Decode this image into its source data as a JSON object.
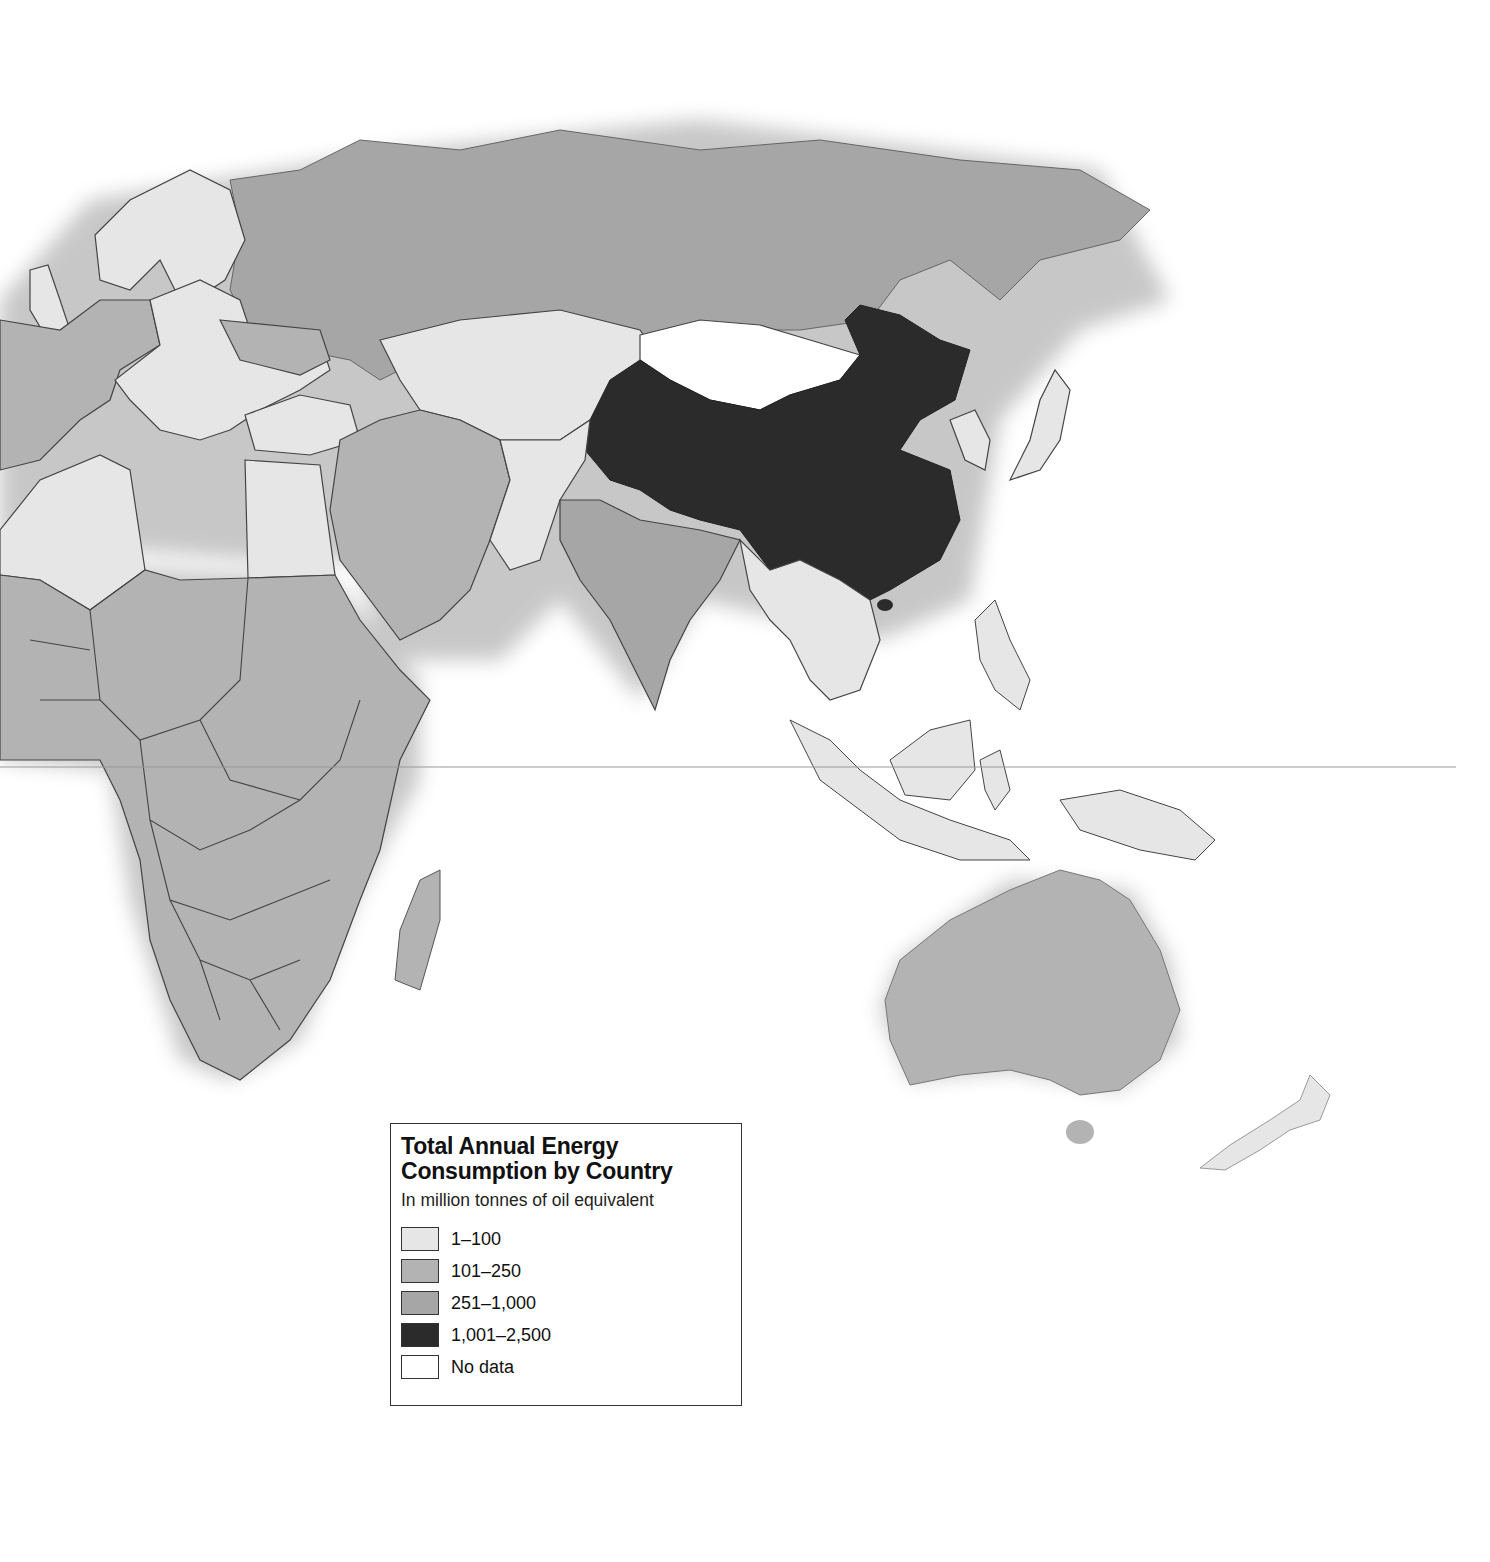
{
  "legend": {
    "title": "Total Annual Energy Consumption by Country",
    "title_line1": "Total Annual Energy",
    "title_line2": "Consumption by Country",
    "subtitle": "In million tonnes of oil equivalent",
    "items": [
      {
        "label": "1–100",
        "color": "#e6e6e6"
      },
      {
        "label": "101–250",
        "color": "#b3b3b3"
      },
      {
        "label": "251–1,000",
        "color": "#a6a6a6"
      },
      {
        "label": "1,001–2,500",
        "color": "#2b2b2b"
      },
      {
        "label": "No data",
        "color": "#ffffff"
      }
    ]
  },
  "map": {
    "colors": {
      "class_1_100": "#e6e6e6",
      "class_101_250": "#b3b3b3",
      "class_251_1000": "#a6a6a6",
      "class_1001_2500": "#2b2b2b",
      "no_data": "#ffffff",
      "border": "#444444",
      "equator": "#999999"
    },
    "regions": [
      {
        "name": "China",
        "class": "1,001–2,500"
      },
      {
        "name": "Russia",
        "class": "251–1,000"
      },
      {
        "name": "India",
        "class": "251–1,000"
      },
      {
        "name": "Japan",
        "class": "251–1,000"
      },
      {
        "name": "Africa (most countries)",
        "class": "101–250"
      },
      {
        "name": "Australia",
        "class": "101–250"
      },
      {
        "name": "Saudi Arabia",
        "class": "101–250"
      },
      {
        "name": "Iran",
        "class": "101–250"
      },
      {
        "name": "Mongolia",
        "class": "No data"
      },
      {
        "name": "Kazakhstan",
        "class": "1–100"
      },
      {
        "name": "Southeast Asia",
        "class": "1–100"
      },
      {
        "name": "Indonesia",
        "class": "1–100"
      },
      {
        "name": "New Zealand",
        "class": "1–100"
      },
      {
        "name": "Egypt",
        "class": "1–100"
      },
      {
        "name": "Algeria",
        "class": "1–100"
      },
      {
        "name": "Eastern Europe",
        "class": "1–100"
      },
      {
        "name": "Scandinavia",
        "class": "1–100"
      }
    ]
  }
}
